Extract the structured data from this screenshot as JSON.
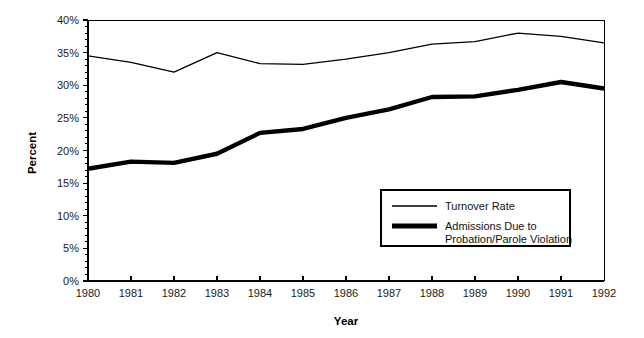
{
  "chart_data": {
    "type": "line",
    "title": "",
    "xlabel": "Year",
    "ylabel": "Percent",
    "x": [
      1980,
      1981,
      1982,
      1983,
      1984,
      1985,
      1986,
      1987,
      1988,
      1989,
      1990,
      1991,
      1992
    ],
    "categories": [
      "1980",
      "1981",
      "1982",
      "1983",
      "1984",
      "1985",
      "1986",
      "1987",
      "1988",
      "1989",
      "1990",
      "1991",
      "1992"
    ],
    "series": [
      {
        "name": "Turnover Rate",
        "style": "thin",
        "values": [
          34.5,
          33.5,
          32.0,
          35.0,
          33.3,
          33.2,
          34.0,
          35.0,
          36.3,
          36.7,
          38.0,
          37.5,
          36.5
        ]
      },
      {
        "name": "Admissions Due to Probation/Parole Violation",
        "style": "bold",
        "values": [
          17.2,
          18.3,
          18.1,
          19.5,
          22.7,
          23.3,
          25.0,
          26.3,
          28.2,
          28.3,
          29.3,
          30.5,
          29.5
        ]
      }
    ],
    "xlim": [
      1980,
      1992
    ],
    "ylim": [
      0,
      40
    ],
    "ytick_labels": [
      "0%",
      "5%",
      "10%",
      "15%",
      "20%",
      "25%",
      "30%",
      "35%",
      "40%"
    ],
    "ytick_values": [
      0,
      5,
      10,
      15,
      20,
      25,
      30,
      35,
      40
    ],
    "ytick_minor_step": 1,
    "grid": false,
    "legend_position": "inside-lower-right",
    "legend_entries": [
      {
        "label": "Turnover Rate",
        "label_line2": "",
        "style": "thin"
      },
      {
        "label": "Admissions Due to",
        "label_line2": "Probation/Parole Violation",
        "style": "bold"
      }
    ],
    "colors": {
      "axis": "#000000",
      "series_thin": "#000000",
      "series_bold": "#000000",
      "background": "#ffffff"
    }
  },
  "labels": {
    "y_axis_title": "Percent",
    "x_axis_title": "Year"
  }
}
